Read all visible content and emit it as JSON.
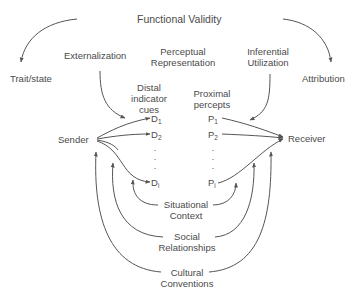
{
  "diagram": {
    "title": "Functional Validity",
    "left_outcome": "Trait/state",
    "right_outcome": "Attribution",
    "stages": {
      "externalization": "Externalization",
      "perceptual_line1": "Perceptual",
      "perceptual_line2": "Representation",
      "inferential_line1": "Inferential",
      "inferential_line2": "Utilization"
    },
    "column_headers": {
      "distal_line1": "Distal",
      "distal_line2": "indicator",
      "distal_line3": "cues",
      "proximal_line1": "Proximal",
      "proximal_line2": "percepts"
    },
    "nodes": {
      "sender": "Sender",
      "receiver": "Receiver"
    },
    "distal_cues": [
      {
        "letter": "D",
        "sub": "1"
      },
      {
        "letter": "D",
        "sub": "2"
      },
      {
        "letter": "D",
        "sub": "i"
      }
    ],
    "proximal_percepts": [
      {
        "letter": "P",
        "sub": "1"
      },
      {
        "letter": "P",
        "sub": "2"
      },
      {
        "letter": "P",
        "sub": "i"
      }
    ],
    "ellipsis": "·",
    "contexts": {
      "situational_line1": "Situational",
      "situational_line2": "Context",
      "social_line1": "Social",
      "social_line2": "Relationships",
      "cultural_line1": "Cultural",
      "cultural_line2": "Conventions"
    },
    "colors": {
      "text": "#4a4a4a",
      "lines": "#555555",
      "background": "#ffffff"
    }
  }
}
